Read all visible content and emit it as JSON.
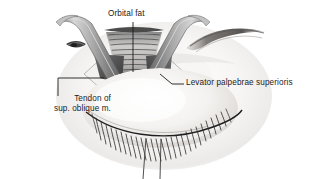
{
  "figure": {
    "kind": "anatomical-illustration",
    "background_color": "#ffffff",
    "ink_color": "#1b1b1b"
  },
  "labels": {
    "orbital_fat": "Orbital fat",
    "levator": "Levator palpebrae superioris",
    "tendon_line1": "Tendon of",
    "tendon_line2": "sup. oblique m."
  },
  "parts": {
    "retractor_left": "retractor-blade-left",
    "retractor_right": "retractor-blade-right",
    "orbital_fat_pad": "orbital-fat-pad",
    "levator_aponeurosis": "levator-aponeurosis",
    "superior_oblique_tendon": "superior-oblique-tendon",
    "eyebrow": "eyebrow",
    "upper_lid": "upper-eyelid",
    "lower_lid": "lower-eyelid",
    "eyelashes": "eyelashes",
    "suture_left": "suture-thread-left",
    "suture_right": "suture-thread-right"
  },
  "colors": {
    "skin_light": "#f3f1ef",
    "skin_shadow": "#d8d4d1",
    "metal_light": "#c9c9c9",
    "metal_mid": "#9a9a9a",
    "metal_dark": "#6d6d6d",
    "tissue_dark": "#4a4a4a",
    "tissue_mid": "#8f8f8f",
    "line": "#2a2a2a"
  }
}
